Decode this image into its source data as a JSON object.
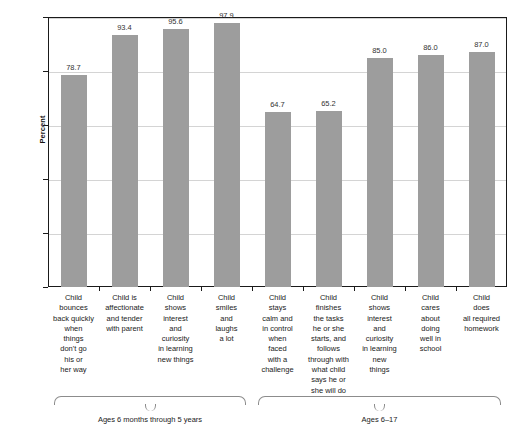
{
  "chart_data": {
    "type": "bar",
    "title": "",
    "xlabel": "",
    "ylabel": "Percent",
    "ylim": [
      0,
      100
    ],
    "yticks": [
      0,
      20,
      40,
      60,
      80,
      100
    ],
    "grid": "horizontal",
    "legend": "none",
    "bar_color": "#9d9d9d",
    "categories": [
      "Child bounces back quickly when things don't go his or her way",
      "Child is affectionate and tender with parent",
      "Child shows interest and curiosity in learning new things",
      "Child smiles and laughs a lot",
      "Child stays calm and in control when faced with a challenge",
      "Child finishes the tasks he or she starts, and follows through with what child says he or she will do",
      "Child shows interest and curiosity in learning new things",
      "Child cares about doing well in school",
      "Child does all required homework"
    ],
    "category_lines": [
      [
        "Child",
        "bounces",
        "back quickly",
        "when",
        "things",
        "don't go",
        "his or",
        "her way"
      ],
      [
        "Child is",
        "affectionate",
        "and tender",
        "with parent"
      ],
      [
        "Child",
        "shows",
        "interest",
        "and",
        "curiosity",
        "in learning",
        "new things"
      ],
      [
        "Child",
        "smiles",
        "and",
        "laughs",
        "a lot"
      ],
      [
        "Child",
        "stays",
        "calm and",
        "in control",
        "when",
        "faced",
        "with a",
        "challenge"
      ],
      [
        "Child",
        "finishes",
        "the tasks",
        "he or she",
        "starts, and",
        "follows",
        "through with",
        "what child",
        "says he or",
        "she will do"
      ],
      [
        "Child",
        "shows",
        "interest",
        "and",
        "curiosity",
        "in learning",
        "new",
        "things"
      ],
      [
        "Child",
        "cares",
        "about",
        "doing",
        "well in",
        "school"
      ],
      [
        "Child",
        "does",
        "all required",
        "homework"
      ]
    ],
    "values": [
      78.7,
      93.4,
      95.6,
      97.9,
      64.7,
      65.2,
      85.0,
      86.0,
      87.0
    ],
    "value_labels": [
      "78.7",
      "93.4",
      "95.6",
      "97.9",
      "64.7",
      "65.2",
      "85.0",
      "86.0",
      "87.0"
    ],
    "groups": [
      {
        "label": "Ages 6 months through 5 years",
        "first_index": 0,
        "last_index": 3
      },
      {
        "label": "Ages 6–17",
        "first_index": 4,
        "last_index": 8
      }
    ]
  }
}
